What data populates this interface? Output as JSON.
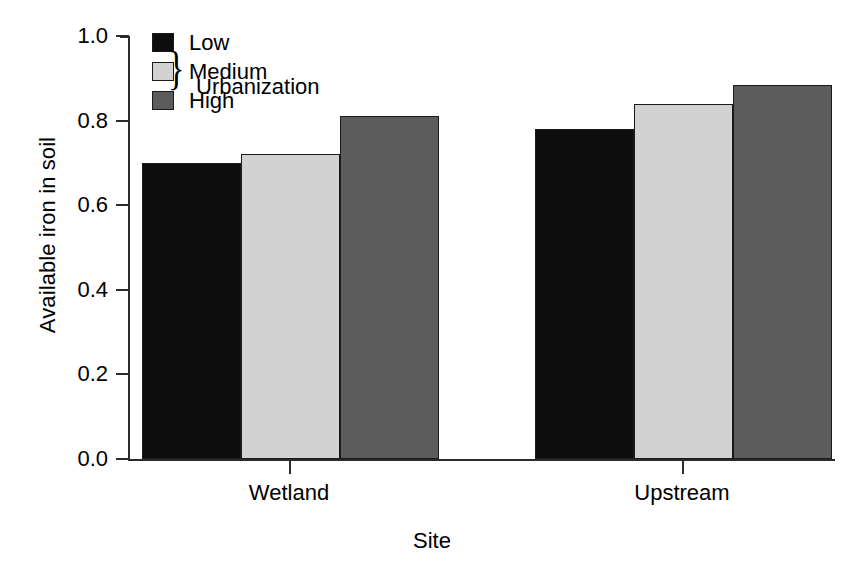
{
  "chart_data": {
    "type": "bar",
    "title": "",
    "xlabel": "Site",
    "ylabel": "Available iron in soil",
    "categories": [
      "Wetland",
      "Upstream"
    ],
    "series": [
      {
        "name": "Low",
        "values": [
          0.7,
          0.78
        ],
        "color": "#0d0d0d"
      },
      {
        "name": "Medium",
        "values": [
          0.72,
          0.84
        ],
        "color": "#d2d2d2"
      },
      {
        "name": "High",
        "values": [
          0.81,
          0.885
        ],
        "color": "#5c5c5c"
      }
    ],
    "legend_title": "Urbanization",
    "legend_brace": "}",
    "legend_position": "top-left-inside",
    "ylim": [
      0.0,
      1.0
    ],
    "yticks": [
      "0.0",
      "0.2",
      "0.4",
      "0.6",
      "0.8",
      "1.0"
    ],
    "ytick_values": [
      0.0,
      0.2,
      0.4,
      0.6,
      0.8,
      1.0
    ],
    "grid": false,
    "axis_color": "#2b2b2b",
    "background": "#ffffff"
  }
}
